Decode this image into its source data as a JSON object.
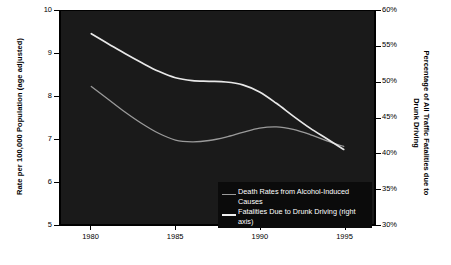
{
  "chart_data": {
    "type": "line",
    "title": "",
    "xlabel": "",
    "ylabel": "Rate per 100,000 Population (age adjusted)",
    "y2label": "Percentage of All Traffic Fatalities due to Drunk Driving",
    "background": "#1a1a1a",
    "grid": false,
    "legend_position": "bottom-right",
    "xlim": [
      1978.2,
      1996.8
    ],
    "xticks": [
      1980,
      1985,
      1990,
      1995
    ],
    "xticklabels": [
      "1980",
      "1985",
      "1990",
      "1995"
    ],
    "ylim": [
      5,
      10
    ],
    "yticks": [
      5,
      6,
      7,
      8,
      9,
      10
    ],
    "yticklabels": [
      "5",
      "6",
      "7",
      "8",
      "9",
      "10"
    ],
    "y2lim": [
      30,
      60
    ],
    "y2ticks": [
      30,
      35,
      40,
      45,
      50,
      55,
      60
    ],
    "y2ticklabels": [
      "30%",
      "35%",
      "40%",
      "45%",
      "50%",
      "55%",
      "60%"
    ],
    "series": [
      {
        "name": "Death Rates from Alcohol-Induced Causes",
        "axis": "left",
        "color": "#9a9a9a",
        "x": [
          1980,
          1981,
          1982,
          1983,
          1984,
          1985,
          1986,
          1987,
          1988,
          1989,
          1990,
          1991,
          1992,
          1993,
          1994,
          1995
        ],
        "y": [
          8.23,
          7.93,
          7.63,
          7.36,
          7.13,
          6.97,
          6.93,
          6.96,
          7.04,
          7.15,
          7.25,
          7.28,
          7.22,
          7.1,
          6.95,
          6.82
        ]
      },
      {
        "name": "Fatalities Due to Drunk Driving (right axis)",
        "axis": "right",
        "color": "#e8e8e8",
        "x": [
          1980,
          1981,
          1982,
          1983,
          1984,
          1985,
          1986,
          1987,
          1988,
          1989,
          1990,
          1991,
          1992,
          1993,
          1994,
          1995
        ],
        "y": [
          56.8,
          55.4,
          54.0,
          52.7,
          51.5,
          50.6,
          50.2,
          50.1,
          50.0,
          49.6,
          48.6,
          47.0,
          45.2,
          43.5,
          42.0,
          40.5
        ]
      }
    ]
  },
  "legend": {
    "items": [
      {
        "label": "Death Rates from Alcohol-Induced Causes",
        "color": "#9a9a9a"
      },
      {
        "label": "Fatalities Due to Drunk Driving (right axis)",
        "color": "#f0f0f0"
      }
    ]
  },
  "axes": {
    "left_title": "Rate per 100,000 Population (age adjusted)",
    "right_title_line1": "Percentage of All Traffic Fatalities due to",
    "right_title_line2": "Drunk Driving"
  }
}
